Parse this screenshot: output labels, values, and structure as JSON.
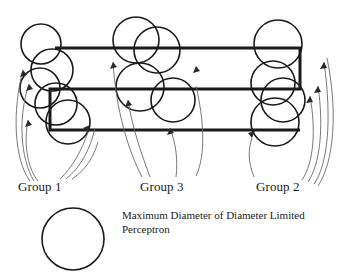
{
  "figure": {
    "background_color": "#ffffff",
    "stroke_color": "#1a1a1a",
    "thin_stroke_color": "#555555",
    "width": 345,
    "height": 277
  },
  "labels": {
    "group_1": "Group 1",
    "group_3": "Group 3",
    "group_2": "Group 2"
  },
  "legend": {
    "caption_line_1": "Maximum Diameter of Diameter Limited",
    "caption_line_2": "Perceptron",
    "circle_name": "max-diameter-circle",
    "circle_cx": 73,
    "circle_cy": 239,
    "circle_r": 31
  },
  "chart_data": {
    "type": "diagram",
    "title": "Maximum Diameter of Diameter Limited Perceptron",
    "groups": [
      {
        "name": "Group 1",
        "label_x": 18,
        "label_y": 179,
        "circles": [
          {
            "cx": 41,
            "cy": 44,
            "r": 20
          },
          {
            "cx": 52,
            "cy": 70,
            "r": 21
          },
          {
            "cx": 40,
            "cy": 88,
            "r": 20
          },
          {
            "cx": 56,
            "cy": 104,
            "r": 21
          },
          {
            "cx": 68,
            "cy": 122,
            "r": 22
          }
        ]
      },
      {
        "name": "Group 3",
        "label_x": 140,
        "label_y": 179,
        "circles": [
          {
            "cx": 136,
            "cy": 40,
            "r": 23
          },
          {
            "cx": 157,
            "cy": 50,
            "r": 23
          },
          {
            "cx": 140,
            "cy": 87,
            "r": 24
          },
          {
            "cx": 173,
            "cy": 100,
            "r": 22
          }
        ]
      },
      {
        "name": "Group 2",
        "label_x": 256,
        "label_y": 179,
        "circles": [
          {
            "cx": 278,
            "cy": 44,
            "r": 24
          },
          {
            "cx": 273,
            "cy": 83,
            "r": 22
          },
          {
            "cx": 283,
            "cy": 100,
            "r": 22
          },
          {
            "cx": 275,
            "cy": 122,
            "r": 24
          }
        ]
      }
    ],
    "serpentine_path": {
      "stroke_width": 3,
      "points": [
        [
          55,
          48
        ],
        [
          300,
          48
        ],
        [
          300,
          89
        ],
        [
          50,
          89
        ],
        [
          50,
          130
        ],
        [
          300,
          130
        ]
      ]
    }
  }
}
